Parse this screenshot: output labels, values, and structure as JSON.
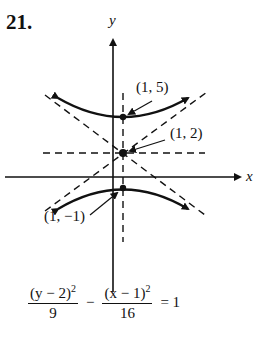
{
  "problem": {
    "number": "21."
  },
  "axes": {
    "x_label": "x",
    "y_label": "y"
  },
  "points": [
    {
      "label": "(1, 5)",
      "role": "upper vertex"
    },
    {
      "label": "(1, 2)",
      "role": "center"
    },
    {
      "label": "(1, −1)",
      "role": "lower vertex"
    }
  ],
  "equation": {
    "term1_numerator": "(y − 2)",
    "term1_exp": "2",
    "term1_denominator": "9",
    "operator": "−",
    "term2_numerator": "(x − 1)",
    "term2_exp": "2",
    "term2_denominator": "16",
    "rhs": "= 1"
  }
}
